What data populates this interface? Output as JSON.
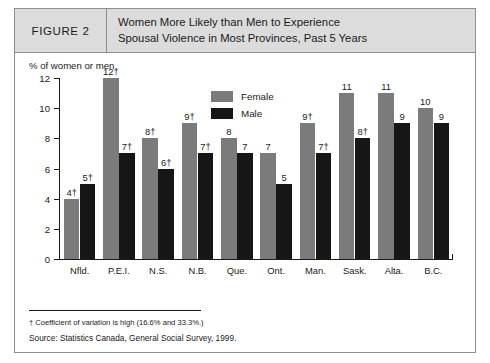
{
  "figure": {
    "number_label": "FIGURE 2",
    "title_lines": [
      "Women More Likely than Men to Experience",
      "Spousal Violence in Most Provinces, Past 5 Years"
    ]
  },
  "footer": {
    "footnote": "† Coefficient of variation is high (16.6% and 33.3%.)",
    "source": "Source:  Statistics Canada, General Social Survey, 1999."
  },
  "colors": {
    "female_bar": "#7b7b7b",
    "male_bar": "#161616",
    "header_background": "#dcdcdc",
    "border": "#8e8e8e",
    "text": "#1a1a1a"
  },
  "chart_data": {
    "type": "bar",
    "title": "Women More Likely than Men to Experience Spousal Violence in Most Provinces, Past 5 Years",
    "subtitle": "",
    "xlabel": "",
    "ylabel": "% of women or men",
    "ylim": [
      0,
      12
    ],
    "yticks": [
      0,
      2,
      4,
      6,
      8,
      10,
      12
    ],
    "ytick_labels": [
      "0",
      "2",
      "4",
      "6",
      "8",
      "10",
      "12"
    ],
    "grid": false,
    "legend_position": "inside-top-center",
    "categories": [
      "Nfld.",
      "P.E.I.",
      "N.S.",
      "N.B.",
      "Que.",
      "Ont.",
      "Man.",
      "Sask.",
      "Alta.",
      "B.C."
    ],
    "series": [
      {
        "name": "Female",
        "color": "#7b7b7b",
        "values": [
          4,
          12,
          8,
          9,
          8,
          7,
          9,
          11,
          11,
          10
        ],
        "labels": [
          "4†",
          "12†",
          "8†",
          "9†",
          "8",
          "7",
          "9†",
          "11",
          "11",
          "10"
        ]
      },
      {
        "name": "Male",
        "color": "#161616",
        "values": [
          5,
          7,
          6,
          7,
          7,
          5,
          7,
          8,
          9,
          9
        ],
        "labels": [
          "5†",
          "7†",
          "6†",
          "7†",
          "7",
          "5",
          "7†",
          "8†",
          "9",
          "9"
        ]
      }
    ],
    "annotations": [
      "† Coefficient of variation is high (16.6% and 33.3%.)",
      "Source:  Statistics Canada, General Social Survey, 1999."
    ]
  }
}
